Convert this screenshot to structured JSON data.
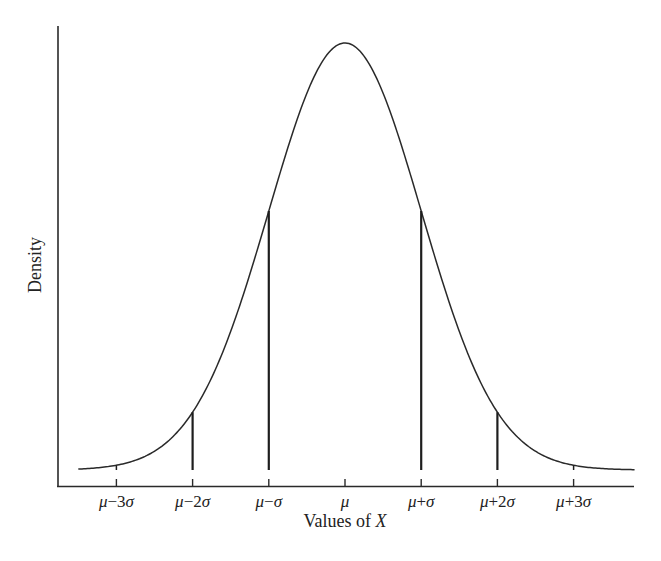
{
  "chart_data": {
    "type": "line",
    "title": "",
    "subtitle": "Normal distribution density curve",
    "xlabel": "Values of X",
    "xlabel_parts": [
      "Values of ",
      "X"
    ],
    "ylabel": "Density",
    "grid": false,
    "legend": null,
    "x_ticks": [
      {
        "label": "μ−3σ",
        "z": -3,
        "greek": "μ",
        "op": "−",
        "coef": "3",
        "sym": "σ"
      },
      {
        "label": "μ−2σ",
        "z": -2,
        "greek": "μ",
        "op": "−",
        "coef": "2",
        "sym": "σ"
      },
      {
        "label": "μ−σ",
        "z": -1,
        "greek": "μ",
        "op": "−",
        "coef": "",
        "sym": "σ"
      },
      {
        "label": "μ",
        "z": 0,
        "greek": "μ",
        "op": "",
        "coef": "",
        "sym": ""
      },
      {
        "label": "μ+σ",
        "z": 1,
        "greek": "μ",
        "op": "+",
        "coef": "",
        "sym": "σ"
      },
      {
        "label": "μ+2σ",
        "z": 2,
        "greek": "μ",
        "op": "+",
        "coef": "2",
        "sym": "σ"
      },
      {
        "label": "μ+3σ",
        "z": 3,
        "greek": "μ",
        "op": "+",
        "coef": "3",
        "sym": "σ"
      }
    ],
    "xlim_z": [
      -3.5,
      3.8
    ],
    "series": [
      {
        "name": "Normal density",
        "function": "standard normal pdf",
        "x_z": [
          -3.5,
          -3,
          -2.5,
          -2,
          -1.5,
          -1,
          -0.5,
          0,
          0.5,
          1,
          1.5,
          2,
          2.5,
          3,
          3.5
        ],
        "y_relative": [
          0.002,
          0.011,
          0.044,
          0.135,
          0.325,
          0.607,
          0.882,
          1.0,
          0.882,
          0.607,
          0.325,
          0.135,
          0.044,
          0.011,
          0.002
        ]
      }
    ],
    "vertical_lines_at_z": [
      -3,
      -2,
      -1,
      1,
      2,
      3
    ],
    "annotations": []
  },
  "colors": {
    "background": "#ffffff",
    "stroke": "#2a2a2a",
    "text": "#222222"
  }
}
